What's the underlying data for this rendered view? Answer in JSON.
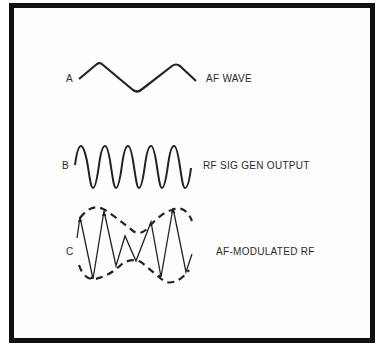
{
  "diagram": {
    "rows": [
      {
        "letter": "A",
        "caption": "AF WAVE",
        "description": "low-frequency audio sine wave"
      },
      {
        "letter": "B",
        "caption": "RF SIG GEN OUTPUT",
        "description": "high-frequency RF sine wave"
      },
      {
        "letter": "C",
        "caption": "AF-MODULATED RF",
        "description": "RF carrier amplitude-modulated by AF, dashed envelope"
      }
    ],
    "colors": {
      "border": "#111111",
      "stroke": "#222222",
      "background": "#ffffff"
    }
  }
}
